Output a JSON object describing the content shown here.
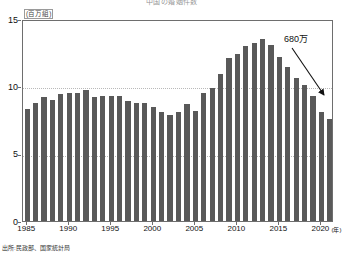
{
  "chart_data": {
    "type": "bar",
    "title": "中国の婚姻件数",
    "xlabel": "(年)",
    "ylabel": "(百万組)",
    "ylim": [
      0,
      15
    ],
    "yticks": [
      0,
      5,
      10,
      15
    ],
    "xticks": [
      "1985",
      "1990",
      "1995",
      "2000",
      "2005",
      "2010",
      "2015",
      "2020"
    ],
    "grid": true,
    "legend": null,
    "bar_color": "#595959",
    "categories": [
      "1985",
      "1986",
      "1987",
      "1988",
      "1989",
      "1990",
      "1991",
      "1992",
      "1993",
      "1994",
      "1995",
      "1996",
      "1997",
      "1998",
      "1999",
      "2000",
      "2001",
      "2002",
      "2003",
      "2004",
      "2005",
      "2006",
      "2007",
      "2008",
      "2009",
      "2010",
      "2011",
      "2012",
      "2013",
      "2014",
      "2015",
      "2016",
      "2017",
      "2018",
      "2019",
      "2020",
      "2021"
    ],
    "values": [
      8.3,
      8.8,
      9.2,
      9.0,
      9.4,
      9.5,
      9.5,
      9.7,
      9.2,
      9.3,
      9.3,
      9.3,
      8.9,
      8.8,
      8.8,
      8.5,
      8.1,
      7.9,
      8.1,
      8.7,
      8.2,
      9.5,
      9.9,
      10.9,
      12.1,
      12.4,
      13.0,
      13.2,
      13.5,
      13.1,
      12.2,
      11.4,
      10.6,
      10.1,
      9.3,
      8.1,
      7.6
    ],
    "annotations": [
      {
        "text": "680万",
        "target_category": "2021",
        "target_value": 6.8
      }
    ],
    "source": "出所:民政部、国家統計局"
  }
}
